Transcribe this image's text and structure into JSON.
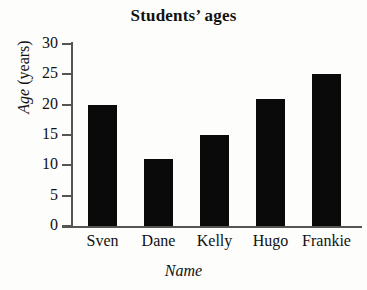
{
  "chart_data": {
    "type": "bar",
    "title": "Students’ ages",
    "categories": [
      "Sven",
      "Dane",
      "Kelly",
      "Hugo",
      "Frankie"
    ],
    "values": [
      20,
      11,
      15,
      21,
      25
    ],
    "xlabel": "Name",
    "ylabel_italic": "Age",
    "ylabel_roman": " (years)",
    "ylabel": "Age (years)",
    "ylim": [
      0,
      30
    ],
    "y_ticks": [
      0,
      5,
      10,
      15,
      20,
      25,
      30
    ],
    "y_tick_labels": [
      "0",
      "5",
      "10",
      "15",
      "20",
      "25",
      "30"
    ],
    "grid": false,
    "legend": false,
    "bar_color": "#0a0a0a",
    "axis_color": "#555555",
    "background_color": "#fdfdfc"
  }
}
